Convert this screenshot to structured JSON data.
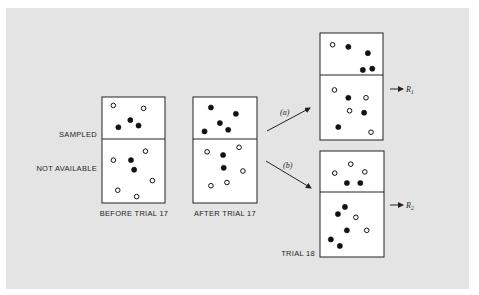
{
  "row_labels": {
    "sampled": "SAMPLED",
    "not_available": "NOT AVAILABLE"
  },
  "boxes": [
    {
      "id": "before-trial-17",
      "caption": "BEFORE TRIAL 17",
      "top": [
        {
          "x": 0.18,
          "y": 0.2,
          "filled": false
        },
        {
          "x": 0.66,
          "y": 0.27,
          "filled": false
        },
        {
          "x": 0.45,
          "y": 0.55,
          "filled": true
        },
        {
          "x": 0.26,
          "y": 0.72,
          "filled": true
        },
        {
          "x": 0.58,
          "y": 0.68,
          "filled": true
        }
      ],
      "bottom": [
        {
          "x": 0.69,
          "y": 0.19,
          "filled": false
        },
        {
          "x": 0.18,
          "y": 0.33,
          "filled": false
        },
        {
          "x": 0.46,
          "y": 0.33,
          "filled": true
        },
        {
          "x": 0.51,
          "y": 0.48,
          "filled": true
        },
        {
          "x": 0.8,
          "y": 0.65,
          "filled": false
        },
        {
          "x": 0.25,
          "y": 0.8,
          "filled": false
        },
        {
          "x": 0.55,
          "y": 0.9,
          "filled": false
        }
      ]
    },
    {
      "id": "after-trial-17",
      "caption": "AFTER TRIAL 17",
      "top": [
        {
          "x": 0.28,
          "y": 0.25,
          "filled": true
        },
        {
          "x": 0.67,
          "y": 0.4,
          "filled": true
        },
        {
          "x": 0.42,
          "y": 0.62,
          "filled": true
        },
        {
          "x": 0.18,
          "y": 0.82,
          "filled": true
        },
        {
          "x": 0.55,
          "y": 0.78,
          "filled": true
        }
      ],
      "bottom": [
        {
          "x": 0.22,
          "y": 0.2,
          "filled": false
        },
        {
          "x": 0.47,
          "y": 0.25,
          "filled": true
        },
        {
          "x": 0.72,
          "y": 0.13,
          "filled": false
        },
        {
          "x": 0.48,
          "y": 0.45,
          "filled": true
        },
        {
          "x": 0.78,
          "y": 0.5,
          "filled": false
        },
        {
          "x": 0.28,
          "y": 0.73,
          "filled": false
        },
        {
          "x": 0.53,
          "y": 0.68,
          "filled": false
        }
      ]
    },
    {
      "id": "trial-18-a",
      "caption": "",
      "outcome": "R",
      "outcome_sub": "1",
      "top": [
        {
          "x": 0.2,
          "y": 0.28,
          "filled": false
        },
        {
          "x": 0.45,
          "y": 0.33,
          "filled": true
        },
        {
          "x": 0.76,
          "y": 0.48,
          "filled": true
        },
        {
          "x": 0.68,
          "y": 0.88,
          "filled": true
        },
        {
          "x": 0.83,
          "y": 0.85,
          "filled": true
        }
      ],
      "bottom": [
        {
          "x": 0.23,
          "y": 0.23,
          "filled": false
        },
        {
          "x": 0.45,
          "y": 0.35,
          "filled": true
        },
        {
          "x": 0.73,
          "y": 0.35,
          "filled": false
        },
        {
          "x": 0.47,
          "y": 0.55,
          "filled": false
        },
        {
          "x": 0.7,
          "y": 0.58,
          "filled": true
        },
        {
          "x": 0.29,
          "y": 0.8,
          "filled": true
        },
        {
          "x": 0.81,
          "y": 0.88,
          "filled": false
        }
      ]
    },
    {
      "id": "trial-18-b",
      "caption": "TRIAL 18",
      "outcome": "R",
      "outcome_sub": "2",
      "top": [
        {
          "x": 0.48,
          "y": 0.32,
          "filled": false
        },
        {
          "x": 0.23,
          "y": 0.54,
          "filled": false
        },
        {
          "x": 0.7,
          "y": 0.51,
          "filled": false
        },
        {
          "x": 0.42,
          "y": 0.78,
          "filled": true
        },
        {
          "x": 0.63,
          "y": 0.78,
          "filled": true
        }
      ],
      "bottom": [
        {
          "x": 0.39,
          "y": 0.23,
          "filled": true
        },
        {
          "x": 0.28,
          "y": 0.34,
          "filled": true
        },
        {
          "x": 0.56,
          "y": 0.39,
          "filled": false
        },
        {
          "x": 0.42,
          "y": 0.59,
          "filled": true
        },
        {
          "x": 0.73,
          "y": 0.59,
          "filled": false
        },
        {
          "x": 0.17,
          "y": 0.73,
          "filled": true
        },
        {
          "x": 0.31,
          "y": 0.83,
          "filled": true
        }
      ]
    }
  ],
  "branches": {
    "a": "(a)",
    "b": "(b)"
  }
}
